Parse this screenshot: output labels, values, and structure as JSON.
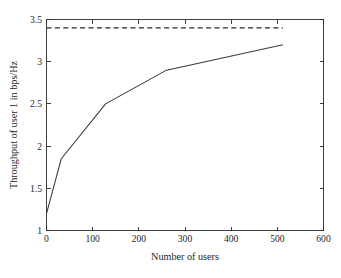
{
  "chart_data": {
    "type": "line",
    "title": "",
    "xlabel": "Number of users",
    "ylabel": "Throughput of user 1 in bps/Hz",
    "xlim": [
      0,
      600
    ],
    "ylim": [
      1,
      3.5
    ],
    "xticks": [
      0,
      100,
      200,
      300,
      400,
      500,
      600
    ],
    "yticks": [
      1,
      1.5,
      2,
      2.5,
      3,
      3.5
    ],
    "xtick_labels": [
      "0",
      "100",
      "200",
      "300",
      "400",
      "500",
      "600"
    ],
    "ytick_labels": [
      "1",
      "1.5",
      "2",
      "2.5",
      "3",
      "3.5"
    ],
    "grid": false,
    "legend": "none",
    "background_color": "#ffffff",
    "axis_color": "#2b2b2b",
    "series": [
      {
        "name": "Throughput of user 1",
        "style": "solid",
        "color": "#3a3a3a",
        "x": [
          0,
          32,
          128,
          260,
          512
        ],
        "values": [
          1.2,
          1.85,
          2.5,
          2.9,
          3.2
        ]
      },
      {
        "name": "Upper bound",
        "style": "dashed",
        "color": "#2b2b2b",
        "x": [
          0,
          512
        ],
        "values": [
          3.4,
          3.4
        ]
      }
    ]
  }
}
